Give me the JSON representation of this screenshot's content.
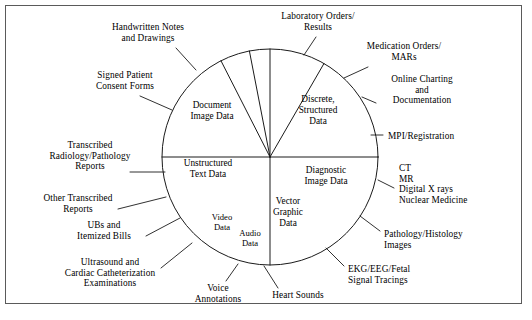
{
  "figure": {
    "type": "pie-segment-concept-diagram",
    "title": "",
    "caption": ""
  },
  "pie": {
    "center_x": 270,
    "center_y": 157,
    "radius": 108,
    "stroke_color": "#1a1a1a",
    "fill_color": "#ffffff",
    "segments": [
      {
        "id": "document-image-data",
        "label_line1": "Document",
        "label_line2": "Image Data",
        "label_line3": "",
        "start_deg": 180,
        "end_deg": 270,
        "label_x": 212,
        "label_y": 100
      },
      {
        "id": "discrete-structured-data",
        "label_line1": "Discrete,",
        "label_line2": "Structured",
        "label_line3": "Data",
        "start_deg": 270,
        "end_deg": 360,
        "label_x": 318,
        "label_y": 94
      },
      {
        "id": "unstructured-text-data",
        "label_line1": "Unstructured",
        "label_line2": "Text Data",
        "label_line3": "",
        "start_deg": 117,
        "end_deg": 180,
        "label_x": 208,
        "label_y": 158
      },
      {
        "id": "video-data",
        "label_line1": "Video",
        "label_line2": "Data",
        "label_line3": "",
        "start_deg": 101,
        "end_deg": 117,
        "label_x": 222,
        "label_y": 212
      },
      {
        "id": "audio-data",
        "label_line1": "Audio",
        "label_line2": "Data",
        "label_line3": "",
        "start_deg": 90,
        "end_deg": 101,
        "label_x": 250,
        "label_y": 228
      },
      {
        "id": "vector-graphic-data",
        "label_line1": "Vector",
        "label_line2": "Graphic",
        "label_line3": "Data",
        "start_deg": 60,
        "end_deg": 90,
        "label_x": 288,
        "label_y": 196
      },
      {
        "id": "diagnostic-image-data",
        "label_line1": "Diagnostic",
        "label_line2": "Image Data",
        "label_line3": "",
        "start_deg": 0,
        "end_deg": 60,
        "label_x": 326,
        "label_y": 165
      }
    ]
  },
  "callouts": [
    {
      "id": "handwritten-notes-and-drawings",
      "text_lines": [
        "Handwritten Notes",
        "and Drawings"
      ],
      "x": 148,
      "y": 22,
      "align": "ctr",
      "leader": {
        "x1": 176,
        "y1": 48,
        "x2": 196,
        "y2": 70
      }
    },
    {
      "id": "signed-patient-consent-forms",
      "text_lines": [
        "Signed Patient",
        "Consent Forms"
      ],
      "x": 125,
      "y": 70,
      "align": "ctr",
      "leader": {
        "x1": 140,
        "y1": 96,
        "x2": 172,
        "y2": 110
      }
    },
    {
      "id": "transcribed-radiology-pathology-reports",
      "text_lines": [
        "Transcribed",
        "Radiology/Pathology",
        "Reports"
      ],
      "x": 90,
      "y": 140,
      "align": "ctr",
      "leader": {
        "x1": 130,
        "y1": 172,
        "x2": 165,
        "y2": 172
      }
    },
    {
      "id": "other-transcribed-reports",
      "text_lines": [
        "Other Transcribed",
        "Reports"
      ],
      "x": 78,
      "y": 193,
      "align": "ctr",
      "leader": {
        "x1": 118,
        "y1": 209,
        "x2": 166,
        "y2": 197
      }
    },
    {
      "id": "ubs-and-itemized-bills",
      "text_lines": [
        "UBs and",
        "Itemized Bills"
      ],
      "x": 104,
      "y": 220,
      "align": "ctr",
      "leader": {
        "x1": 146,
        "y1": 236,
        "x2": 180,
        "y2": 218
      }
    },
    {
      "id": "ultrasound-cardiac-catheterization",
      "text_lines": [
        "Ultrasound and",
        "Cardiac Catheterization",
        "Examinations"
      ],
      "x": 110,
      "y": 257,
      "align": "ctr",
      "leader": {
        "x1": 161,
        "y1": 268,
        "x2": 192,
        "y2": 243
      }
    },
    {
      "id": "voice-annotations",
      "text_lines": [
        "Voice",
        "Annotations"
      ],
      "x": 218,
      "y": 283,
      "align": "ctr",
      "leader": {
        "x1": 226,
        "y1": 281,
        "x2": 238,
        "y2": 264
      }
    },
    {
      "id": "heart-sounds",
      "text_lines": [
        "Heart Sounds"
      ],
      "x": 298,
      "y": 290,
      "align": "ctr",
      "leader": {
        "x1": 278,
        "y1": 288,
        "x2": 264,
        "y2": 266
      }
    },
    {
      "id": "laboratory-orders-results",
      "text_lines": [
        "Laboratory Orders/",
        "Results"
      ],
      "x": 318,
      "y": 11,
      "align": "ctr",
      "leader": {
        "x1": 316,
        "y1": 37,
        "x2": 304,
        "y2": 55
      }
    },
    {
      "id": "medication-orders-mars",
      "text_lines": [
        "Medication Orders/",
        "MARs"
      ],
      "x": 404,
      "y": 41,
      "align": "ctr",
      "leader": {
        "x1": 368,
        "y1": 67,
        "x2": 344,
        "y2": 78
      }
    },
    {
      "id": "online-charting-and-documentation",
      "text_lines": [
        "Online Charting",
        "and",
        "Documentation"
      ],
      "x": 422,
      "y": 74,
      "align": "ctr",
      "leader": {
        "x1": 376,
        "y1": 103,
        "x2": 362,
        "y2": 97
      }
    },
    {
      "id": "mpi-registration",
      "text_lines": [
        "MPI/Registration"
      ],
      "x": 388,
      "y": 131,
      "align": "lft",
      "leader": {
        "x1": 383,
        "y1": 135,
        "x2": 371,
        "y2": 135
      }
    },
    {
      "id": "ct-mr-digital-xrays-nuclear-medicine",
      "text_lines": [
        "CT",
        "MR",
        "Digital X rays",
        "Nuclear Medicine"
      ],
      "x": 399,
      "y": 163,
      "align": "lft",
      "leader": {
        "x1": 394,
        "y1": 188,
        "x2": 378,
        "y2": 180
      }
    },
    {
      "id": "pathology-histology-images",
      "text_lines": [
        "Pathology/Histology",
        "Images"
      ],
      "x": 384,
      "y": 229,
      "align": "lft",
      "leader": {
        "x1": 380,
        "y1": 231,
        "x2": 360,
        "y2": 216
      }
    },
    {
      "id": "ekg-eeg-fetal-signal-tracings",
      "text_lines": [
        "EKG/EEG/Fetal",
        "Signal Tracings"
      ],
      "x": 348,
      "y": 264,
      "align": "lft",
      "leader": {
        "x1": 344,
        "y1": 266,
        "x2": 326,
        "y2": 248
      }
    }
  ]
}
